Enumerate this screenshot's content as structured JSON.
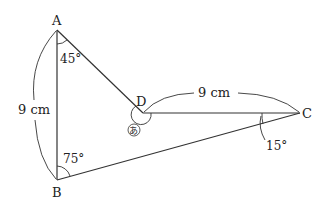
{
  "diagram": {
    "points": {
      "A": {
        "label": "A",
        "x": 57,
        "y": 30
      },
      "B": {
        "label": "B",
        "x": 57,
        "y": 180
      },
      "C": {
        "label": "C",
        "x": 300,
        "y": 113
      },
      "D": {
        "label": "D",
        "x": 143,
        "y": 113
      }
    },
    "segments": [
      "AB",
      "AD",
      "DC",
      "BC"
    ],
    "lengths": {
      "AB": "9 cm",
      "DC": "9 cm"
    },
    "angles": {
      "A": "45°",
      "B": "75°",
      "C": "15°",
      "D": "あ"
    },
    "line_color": "#333333"
  }
}
